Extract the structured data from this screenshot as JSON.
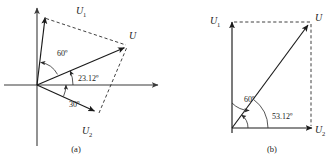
{
  "figure": {
    "kind": "phasor-diagram-pair",
    "background_color": "#ffffff",
    "ink_color": "#1a1a1a",
    "panels": [
      {
        "caption": "(a)",
        "origin": [
          37,
          85
        ],
        "axes": {
          "horizontal_label": "",
          "vertical_label": ""
        },
        "vectors": [
          {
            "name": "U1",
            "label": "U",
            "subscript": "1",
            "angle_deg": 83.12,
            "length_px": 68,
            "style": "solid",
            "label_pos": [
              76,
              13
            ]
          },
          {
            "name": "U",
            "label": "U",
            "subscript": "",
            "angle_deg": 23.12,
            "length_px": 95,
            "style": "solid",
            "label_pos": [
              128,
              36
            ]
          },
          {
            "name": "U2",
            "label": "U",
            "subscript": "2",
            "angle_deg": -26.88,
            "length_px": 67,
            "style": "solid",
            "label_pos": [
              89,
              131
            ]
          }
        ],
        "construction_lines": [
          {
            "from": "U1_tip",
            "to": "U_tip",
            "style": "dashed"
          },
          {
            "from": "U2_tip",
            "to": "U_tip",
            "style": "dashed"
          }
        ],
        "angle_labels": [
          {
            "text": "60º",
            "value": 60,
            "unit": "degree",
            "pos": [
              62,
              53
            ],
            "between": [
              "U1",
              "U"
            ]
          },
          {
            "text": "23.12º",
            "value": 23.12,
            "unit": "degree",
            "pos": [
              90,
              80
            ],
            "between": [
              "U",
              "x-axis"
            ]
          },
          {
            "text": "30º",
            "value": 30,
            "unit": "degree",
            "pos": [
              75,
              107
            ],
            "between": [
              "U2",
              "x-axis"
            ]
          }
        ]
      },
      {
        "caption": "(b)",
        "origin": [
          232,
          128
        ],
        "axes": {
          "horizontal_label": "U",
          "vertical_label": "U"
        },
        "vectors": [
          {
            "name": "U1",
            "label": "U",
            "subscript": "1",
            "angle_deg": 90,
            "length_px": 106,
            "style": "solid",
            "label_pos": [
              215,
              20
            ]
          },
          {
            "name": "U",
            "label": "U",
            "subscript": "",
            "angle_deg": 53.12,
            "length_px": 110,
            "style": "solid",
            "label_pos": [
              316,
              18
            ]
          },
          {
            "name": "U2",
            "label": "U",
            "subscript": "2",
            "angle_deg": 0,
            "length_px": 80,
            "style": "solid",
            "label_pos": [
              318,
              132
            ]
          }
        ],
        "construction_lines": [
          {
            "from": "U1_tip",
            "to": "U_tip",
            "style": "dashed"
          },
          {
            "from": "U2_tip",
            "to": "U_tip",
            "style": "dashed"
          }
        ],
        "angle_labels": [
          {
            "text": "60º",
            "value": 60,
            "unit": "degree",
            "pos": [
              248,
              99
            ],
            "between": [
              "U1",
              "U"
            ]
          },
          {
            "text": "53.12º",
            "value": 53.12,
            "unit": "degree",
            "pos": [
              283,
              116
            ],
            "between": [
              "U",
              "x-axis"
            ]
          }
        ]
      }
    ]
  },
  "labels": {
    "panel_a": {
      "u1": "U",
      "u1_sub": "1",
      "u": "U",
      "u2": "U",
      "u2_sub": "2",
      "angle_60": "60º",
      "angle_2312": "23.12º",
      "angle_30": "30º",
      "caption": "(a)"
    },
    "panel_b": {
      "u1": "U",
      "u1_sub": "1",
      "u": "U",
      "u_axis": "U",
      "u_axis_sub": "2",
      "angle_60": "60º",
      "angle_5312": "53.12º",
      "caption": "(b)"
    }
  }
}
